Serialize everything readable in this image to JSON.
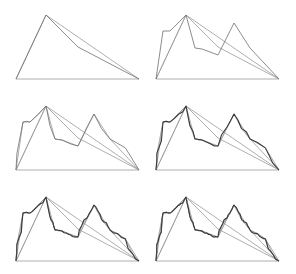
{
  "figure": {
    "line_color": "#6e6e6e",
    "base_color": "#9a9a9a",
    "fine_color": "#3a3a3a",
    "background": "#ffffff",
    "panels": [
      {
        "id": "step-1",
        "row": 1,
        "col": 1,
        "x": 0,
        "y": 0,
        "iterations": 0
      },
      {
        "id": "step-2",
        "row": 1,
        "col": 2,
        "x": 140,
        "y": 0,
        "iterations": 1
      },
      {
        "id": "step-3",
        "row": 2,
        "col": 1,
        "x": 0,
        "y": 91,
        "iterations": 2
      },
      {
        "id": "step-4",
        "row": 2,
        "col": 2,
        "x": 140,
        "y": 91,
        "iterations": 3
      },
      {
        "id": "step-5",
        "row": 3,
        "col": 1,
        "x": 0,
        "y": 182,
        "iterations": 4
      },
      {
        "id": "step-6",
        "row": 3,
        "col": 2,
        "x": 140,
        "y": 182,
        "iterations": 5
      }
    ],
    "base_shape": {
      "base_left": [
        16,
        79
      ],
      "base_right": [
        139,
        79
      ],
      "peak": [
        46,
        15
      ],
      "knee": [
        78,
        47
      ]
    },
    "level1_points": [
      [
        16,
        79
      ],
      [
        23,
        31
      ],
      [
        30,
        31
      ],
      [
        46,
        15
      ],
      [
        55,
        48
      ],
      [
        62,
        49
      ],
      [
        78,
        55
      ],
      [
        94,
        23
      ],
      [
        110,
        48
      ],
      [
        139,
        79
      ]
    ]
  }
}
